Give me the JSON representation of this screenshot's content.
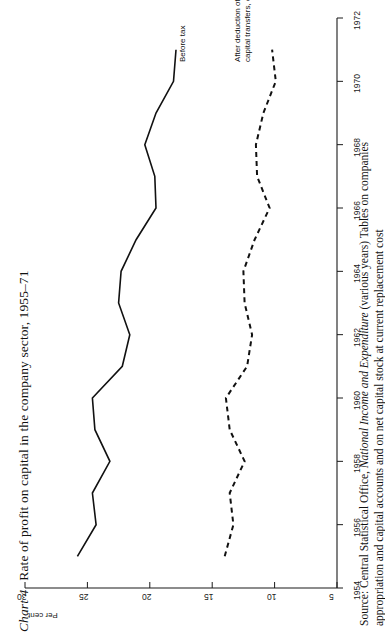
{
  "figure": {
    "label": "Chart 4",
    "title": "Rate of profit on capital in the company sector, 1955–71"
  },
  "source": {
    "line1_prefix": "Source: Central Statistical Office, ",
    "line1_italic": "National Income and Expenditure",
    "line1_suffix": " (various years) Tables on companies",
    "line2": "appropriation and capital accounts and on net capital stock at current replacement cost"
  },
  "axes": {
    "y_axis_title": "Per cent",
    "y_ticks": [
      30,
      25,
      20,
      15,
      10,
      5
    ],
    "y_min": 5,
    "y_max": 30,
    "x_ticks": [
      1954,
      1956,
      1958,
      1960,
      1962,
      1964,
      1966,
      1968,
      1970,
      1972
    ],
    "x_min": 1954,
    "x_max": 1972
  },
  "series_labels": {
    "before_tax": "Before tax",
    "after_tax_line1": "After deduction of tax and addition of",
    "after_tax_line2": "capital transfers, especially investment grants"
  },
  "colors": {
    "ink": "#111111",
    "axis": "#1a1a1a",
    "background": "#ffffff"
  },
  "chart_data": {
    "type": "line",
    "title": "Rate of profit on capital in the company sector, 1955–71",
    "xlabel": "",
    "ylabel": "Per cent",
    "xlim": [
      1954,
      1972
    ],
    "ylim": [
      5,
      30
    ],
    "grid": false,
    "legend": "inline-annotations",
    "x": [
      1955,
      1956,
      1957,
      1958,
      1959,
      1960,
      1961,
      1962,
      1963,
      1964,
      1965,
      1966,
      1967,
      1968,
      1969,
      1970,
      1971
    ],
    "series": [
      {
        "name": "Before tax",
        "style": "solid",
        "values": [
          25.8,
          24.3,
          24.6,
          23.2,
          24.4,
          24.6,
          22.2,
          21.6,
          22.5,
          22.3,
          21.1,
          19.5,
          19.6,
          20.4,
          19.5,
          18.1,
          17.9
        ]
      },
      {
        "name": "After deduction of tax and addition of capital transfers, especially investment grants",
        "style": "dashed",
        "values": [
          14.0,
          13.3,
          13.6,
          12.4,
          13.6,
          13.9,
          12.2,
          11.8,
          12.4,
          12.5,
          11.6,
          10.4,
          11.4,
          11.5,
          10.9,
          9.9,
          10.2
        ]
      }
    ]
  }
}
